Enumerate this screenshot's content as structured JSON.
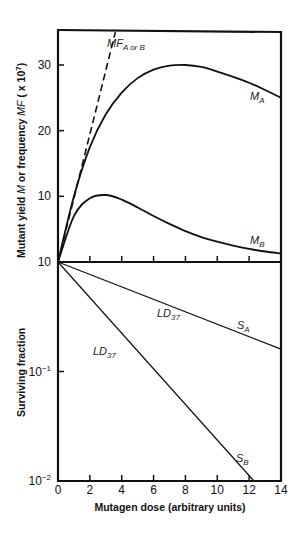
{
  "chart_data": [
    {
      "panel": "upper",
      "type": "line",
      "ylabel": "Mutant yield M or frequency MF ( x 10⁷)",
      "ylabel_parts": [
        "Mutant yield ",
        "M",
        " or frequency ",
        "MF",
        " ( x 10",
        "7",
        ")"
      ],
      "ylim": [
        0,
        35
      ],
      "yticks": [
        10,
        20,
        30
      ],
      "ytick_labels": [
        "10",
        "20",
        "30"
      ],
      "series": [
        {
          "name": "MF A or B",
          "label": "MF",
          "label_sub": "A or B",
          "style": "dashed",
          "x": [
            0,
            3.6
          ],
          "y": [
            0,
            35
          ]
        },
        {
          "name": "M A",
          "label": "M",
          "label_sub": "A",
          "style": "solid",
          "x": [
            0,
            1,
            2,
            3,
            4,
            5,
            6,
            7,
            8,
            9,
            10,
            11,
            12,
            13,
            14
          ],
          "y": [
            0,
            10,
            17.5,
            22.5,
            25.8,
            28,
            29.3,
            29.9,
            30,
            29.7,
            29,
            28.2,
            27.3,
            26.2,
            25
          ]
        },
        {
          "name": "M B",
          "label": "M",
          "label_sub": "B",
          "style": "solid",
          "x": [
            0,
            1,
            2,
            3,
            4,
            5,
            6,
            7,
            8,
            9,
            10,
            11,
            12,
            13,
            14
          ],
          "y": [
            0,
            7,
            9.7,
            10.2,
            9.5,
            8.3,
            7,
            5.8,
            4.7,
            3.8,
            3.1,
            2.5,
            2,
            1.6,
            1.3
          ]
        }
      ]
    },
    {
      "panel": "lower",
      "type": "line",
      "yscale": "log",
      "ylabel": "Surviving fraction",
      "ylim": [
        0.01,
        1
      ],
      "yticks": [
        1,
        0.1,
        0.01
      ],
      "ytick_labels": [
        {
          "base": "10",
          "exp": ""
        },
        {
          "base": "10",
          "exp": "−1"
        },
        {
          "base": "10",
          "exp": "−2"
        }
      ],
      "series": [
        {
          "name": "S A",
          "label": "S",
          "label_sub": "A",
          "x": [
            0,
            14
          ],
          "y": [
            1,
            0.16
          ]
        },
        {
          "name": "S B",
          "label": "S",
          "label_sub": "B",
          "x": [
            0,
            12.3
          ],
          "y": [
            1,
            0.01
          ]
        }
      ],
      "annotations": [
        {
          "text": "LD",
          "sub": "37",
          "series": "S A",
          "x": 6.2
        },
        {
          "text": "LD",
          "sub": "37",
          "series": "S B",
          "x": 2.2
        }
      ]
    }
  ],
  "shared_x": {
    "xlabel": "Mutagen dose (arbitrary units)",
    "xlim": [
      0,
      14
    ],
    "xticks": [
      0,
      2,
      4,
      6,
      8,
      10,
      12,
      14
    ],
    "xtick_labels": [
      "0",
      "2",
      "4",
      "6",
      "8",
      "10",
      "12",
      "14"
    ]
  },
  "colors": {
    "line": "#111111",
    "background": "#ffffff"
  }
}
